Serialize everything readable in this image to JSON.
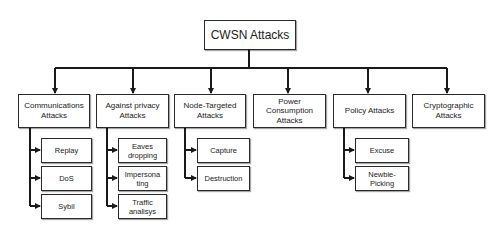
{
  "diagram": {
    "title": "CWSN Attacks",
    "categories": [
      {
        "label": "Communications\nAttacks",
        "children": [
          "Replay",
          "DoS",
          "Sybil"
        ]
      },
      {
        "label": "Against privacy\nAttacks",
        "children": [
          "Eaves\ndropping",
          "Impersona\nting",
          "Traffic\nanalisys"
        ]
      },
      {
        "label": "Node-Targeted\nAttacks",
        "children": [
          "Capture",
          "Destruction"
        ]
      },
      {
        "label": "Power\nConsumption\nAttacks",
        "children": []
      },
      {
        "label": "Policy Attacks",
        "children": [
          "Excuse",
          "Newbie-\nPicking"
        ]
      },
      {
        "label": "Cryptographic\nAttacks",
        "children": []
      }
    ],
    "colors": {
      "line": "#1a1a1a",
      "border": "#2a2a2a",
      "background": "#ffffff"
    }
  }
}
